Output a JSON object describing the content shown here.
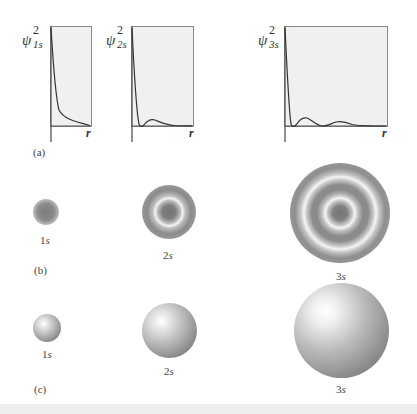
{
  "panel_a": {
    "label": "(a)",
    "plots": [
      {
        "id": "1s",
        "y_label_symbol": "ψ",
        "y_label_sup": "2",
        "y_label_sub": "1s",
        "x_label": "r",
        "nodes": 0
      },
      {
        "id": "2s",
        "y_label_symbol": "ψ",
        "y_label_sup": "2",
        "y_label_sub": "2s",
        "x_label": "r",
        "nodes": 1
      },
      {
        "id": "3s",
        "y_label_symbol": "ψ",
        "y_label_sup": "2",
        "y_label_sub": "3s",
        "x_label": "r",
        "nodes": 2
      }
    ]
  },
  "panel_b": {
    "label": "(b)",
    "clouds": [
      {
        "id": "1s",
        "num": "1",
        "letter": "s"
      },
      {
        "id": "2s",
        "num": "2",
        "letter": "s"
      },
      {
        "id": "3s",
        "num": "3",
        "letter": "s"
      }
    ]
  },
  "panel_c": {
    "label": "(c)",
    "spheres": [
      {
        "id": "1s",
        "num": "1",
        "letter": "s"
      },
      {
        "id": "2s",
        "num": "2",
        "letter": "s"
      },
      {
        "id": "3s",
        "num": "3",
        "letter": "s"
      }
    ]
  },
  "colors": {
    "plot_fill": "#f0f0f0",
    "plot_border": "#8a8a8a",
    "curve": "#333333",
    "cloud_dark": "#7a7a7a",
    "sphere_highlight": "#ffffff",
    "sphere_shadow": "#6e6e6e"
  }
}
